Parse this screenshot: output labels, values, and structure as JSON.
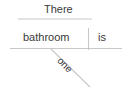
{
  "diagram": {
    "type": "sentence-diagram",
    "style": "reed-kellogg",
    "canvas": {
      "width": 131,
      "height": 88,
      "background": "#ffffff"
    },
    "line_color": "#c8c8c8",
    "text_color": "#3a3a3a",
    "words": {
      "expletive": "There",
      "subject": "bathroom",
      "verb": "is",
      "modifier": "one"
    },
    "lines": {
      "expletive_line": {
        "x1": 18,
        "y1": 19,
        "x2": 92,
        "y2": 19
      },
      "baseline": {
        "x1": 10,
        "y1": 48,
        "x2": 122,
        "y2": 48
      },
      "subject_verb_divider": {
        "x1": 88,
        "y1": 28,
        "x2": 88,
        "y2": 50
      },
      "modifier_line": {
        "x1": 50,
        "y1": 48,
        "x2": 90,
        "y2": 87
      }
    }
  }
}
